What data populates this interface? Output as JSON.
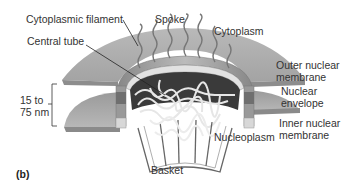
{
  "figure": {
    "panel_label": "(b)",
    "labels": {
      "cytoplasmic_filament": "Cytoplasmic filament",
      "spoke": "Spoke",
      "cytoplasm": "Cytoplasm",
      "central_tube": "Central tube",
      "outer_nuclear_membrane_1": "Outer nuclear",
      "outer_nuclear_membrane_2": "membrane",
      "nuclear_envelope_1": "Nuclear",
      "nuclear_envelope_2": "envelope",
      "inner_nuclear_membrane_1": "Inner nuclear",
      "inner_nuclear_membrane_2": "membrane",
      "nucleoplasm": "Nucleoplasm",
      "basket": "Basket",
      "dimension_1": "15 to",
      "dimension_2": "75 nm"
    },
    "colors": {
      "membrane_fill": "#a9a9a9",
      "membrane_dark": "#8a8a8a",
      "membrane_edge": "#777777",
      "pore_dark": "#3a3a3a",
      "filament": "#e8e8e8",
      "basket_line": "#666666",
      "text": "#333333"
    }
  }
}
